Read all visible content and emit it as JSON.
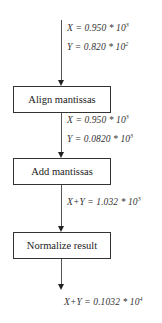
{
  "diagram": {
    "type": "flowchart",
    "steps": [
      {
        "label": "Align mantissas"
      },
      {
        "label": "Add mantissas"
      },
      {
        "label": "Normalize result"
      }
    ],
    "annotations": [
      {
        "lhs": "X",
        "op": " = ",
        "mantissa": "0.950",
        "times": " * ",
        "base": "10",
        "exp": "3"
      },
      {
        "lhs": "Y",
        "op": " = ",
        "mantissa": "0.820",
        "times": " * ",
        "base": "10",
        "exp": "2"
      },
      {
        "lhs": "X",
        "op": " = ",
        "mantissa": "0.950",
        "times": " * ",
        "base": "10",
        "exp": "3"
      },
      {
        "lhs": "Y",
        "op": " = ",
        "mantissa": "0.0820",
        "times": " * ",
        "base": "10",
        "exp": "3"
      },
      {
        "lhs": "X+Y",
        "op": " = ",
        "mantissa": "1.032",
        "times": " * ",
        "base": "10",
        "exp": "3"
      },
      {
        "lhs": "X+Y",
        "op": " = ",
        "mantissa": "0.1032",
        "times": " * ",
        "base": "10",
        "exp": "4"
      }
    ]
  }
}
